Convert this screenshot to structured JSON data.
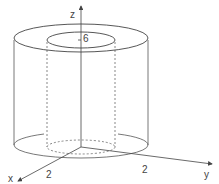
{
  "diagram": {
    "labels": {
      "z_axis": "z",
      "y_axis": "y",
      "x_axis": "x",
      "height": "6",
      "x_radius": "2",
      "y_radius": "2"
    },
    "colors": {
      "stroke": "#555555",
      "text": "#444444"
    }
  }
}
